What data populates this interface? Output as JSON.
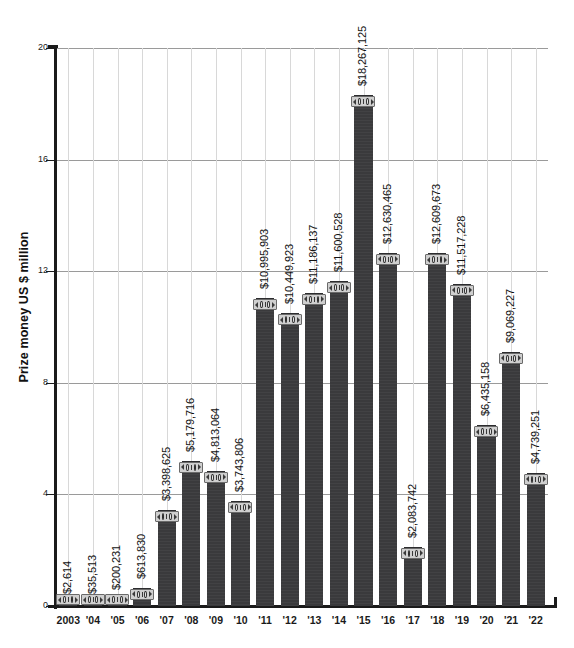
{
  "chart_data": {
    "type": "bar",
    "title": "",
    "xlabel": "",
    "ylabel": "Prize money US $ million",
    "ylim": [
      0,
      20
    ],
    "yticks": [
      0,
      4,
      8,
      12,
      16,
      20
    ],
    "ytick_labels": [
      "0",
      "4",
      "8",
      "12",
      "16",
      "20"
    ],
    "grid": "horizontal gridlines at every y tick; light vertical gridlines at each category",
    "legend": "none",
    "value_label_format": "$#,###",
    "value_label_rotation": -90,
    "bar_color": "#3a3a3c",
    "gridline_color": "#9a9a9a",
    "axis_color": "#1b1b1b",
    "units": "US $ million",
    "categories": [
      "2003",
      "'04",
      "'05",
      "'06",
      "'07",
      "'08",
      "'09",
      "'10",
      "'11",
      "'12",
      "'13",
      "'14",
      "'15",
      "'16",
      "'17",
      "'18",
      "'19",
      "'20",
      "'21",
      "'22"
    ],
    "values": [
      0.002614,
      0.035513,
      0.200231,
      0.61383,
      3.398625,
      5.179716,
      4.813064,
      3.743806,
      10.995903,
      10.449923,
      11.186137,
      11.600528,
      18.267125,
      12.630465,
      2.083742,
      12.609673,
      11.517228,
      6.435158,
      9.069227,
      4.739251
    ],
    "value_labels": [
      "$2,614",
      "$35,513",
      "$200,231",
      "$613,830",
      "$3,398,625",
      "$5,179,716",
      "$4,813,064",
      "$3,743,806",
      "$10,995,903",
      "$10,449,923",
      "$11,186,137",
      "$11,600,528",
      "$18,267,125",
      "$12,630,465",
      "$2,083,742",
      "$12,609,673",
      "$11,517,228",
      "$6,435,158",
      "$9,069,227",
      "$4,739,251"
    ],
    "bar_cap_icon": "banknote-icon"
  }
}
